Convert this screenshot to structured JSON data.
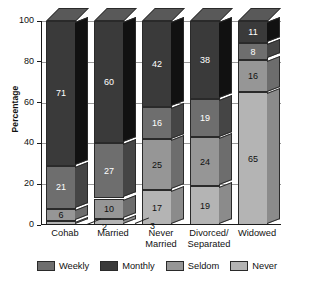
{
  "chart_data": {
    "type": "bar",
    "subtype": "stacked-bar-3d",
    "title": "",
    "xlabel": "",
    "ylabel": "Percentage",
    "ylim": [
      0,
      100
    ],
    "yticks": [
      0,
      20,
      40,
      60,
      80,
      100
    ],
    "grid": true,
    "legend_position": "bottom",
    "stack_order_bottom_to_top": [
      "Never",
      "Seldom",
      "Weekly",
      "Monthly"
    ],
    "categories": [
      "Cohab",
      "Married",
      "Never Married",
      "Divorced/ Separated",
      "Widowed"
    ],
    "series": [
      {
        "name": "Weekly",
        "color": "#6e6e6e",
        "values": [
          21,
          27,
          16,
          19,
          8
        ]
      },
      {
        "name": "Monthly",
        "color": "#3a3a3a",
        "values": [
          71,
          60,
          42,
          38,
          11
        ]
      },
      {
        "name": "Seldom",
        "color": "#969696",
        "values": [
          6,
          10,
          25,
          24,
          16
        ]
      },
      {
        "name": "Never",
        "color": "#b4b4b4",
        "values": [
          2,
          3,
          17,
          19,
          65
        ]
      }
    ]
  },
  "axis": {
    "y_title": "Percentage",
    "y_tick_labels": [
      "0",
      "20",
      "40",
      "60",
      "80",
      "100"
    ]
  },
  "x_labels": [
    {
      "line1": "Cohab",
      "line2": ""
    },
    {
      "line1": "Married",
      "line2": ""
    },
    {
      "line1": "Never",
      "line2": "Married"
    },
    {
      "line1": "Divorced/",
      "line2": "Separated"
    },
    {
      "line1": "Widowed",
      "line2": ""
    }
  ],
  "legend": [
    {
      "label": "Weekly",
      "color": "#6e6e6e"
    },
    {
      "label": "Monthly",
      "color": "#3a3a3a"
    },
    {
      "label": "Seldom",
      "color": "#969696"
    },
    {
      "label": "Never",
      "color": "#b4b4b4"
    }
  ],
  "colors": {
    "weekly": "#6e6e6e",
    "monthly": "#3a3a3a",
    "seldom": "#969696",
    "never": "#b4b4b4",
    "axis": "#1a1a1a",
    "grid": "#9a9a9a",
    "background": "#ffffff",
    "label_light": "#ffffff",
    "label_dark": "#111111"
  }
}
